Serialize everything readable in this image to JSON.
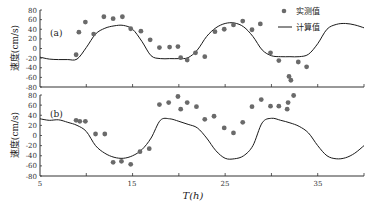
{
  "chart_data": [
    {
      "type": "scatter+line",
      "panel_label": "(a)",
      "xlabel": "T(h)",
      "ylabel": "速度(cm/s)",
      "xlim": [
        5,
        40
      ],
      "ylim": [
        -80,
        80
      ],
      "yticks": [
        80,
        60,
        40,
        20,
        0,
        -20,
        -40,
        -60,
        -80
      ],
      "legend": {
        "measured": "实测值",
        "calculated": "计算值",
        "position": "upper right"
      },
      "measured": {
        "name": "实测值",
        "x": [
          8.9,
          9.2,
          9.9,
          10.8,
          11.9,
          12.9,
          13.9,
          14.8,
          15.9,
          16.9,
          17.9,
          19.0,
          19.9,
          20.2,
          20.9,
          21.8,
          22.8,
          23.9,
          24.9,
          25.9,
          26.9,
          27.9,
          28.8,
          29.9,
          30.8,
          31.9,
          32.1,
          32.9,
          33.8
        ],
        "y": [
          -13,
          34,
          55,
          30,
          66,
          62,
          66,
          41,
          36,
          18,
          2,
          3,
          4,
          -19,
          -24,
          -9,
          -17,
          35,
          40,
          49,
          57,
          39,
          51,
          -9,
          -25,
          -58,
          -66,
          -28,
          -38
        ]
      },
      "calculated": {
        "name": "计算值",
        "x": [
          5,
          6,
          7,
          8,
          9,
          10,
          11,
          12,
          13,
          14,
          15,
          16,
          17,
          18,
          19,
          20,
          21,
          22,
          23,
          24,
          25,
          26,
          27,
          28,
          29,
          30,
          31,
          32,
          33,
          34,
          35,
          36,
          37,
          38,
          39,
          40
        ],
        "y": [
          -18,
          -22,
          -23,
          -23,
          -22,
          2,
          30,
          42,
          47,
          48,
          40,
          15,
          -15,
          -21,
          -21,
          -21,
          -19,
          -3,
          25,
          43,
          52,
          53,
          45,
          25,
          -3,
          -15,
          -17,
          -17,
          -17,
          -12,
          10,
          40,
          50,
          52,
          49,
          43
        ]
      }
    },
    {
      "type": "scatter+line",
      "panel_label": "(b)",
      "xlabel": "T(h)",
      "ylabel": "速度(cm/s)",
      "xlim": [
        5,
        40
      ],
      "ylim": [
        -80,
        80
      ],
      "xticks": [
        5,
        15,
        25,
        35
      ],
      "yticks": [
        80,
        60,
        40,
        20,
        0,
        -20,
        -40,
        -60,
        -80
      ],
      "measured": {
        "name": "实测值",
        "x": [
          8.9,
          9.3,
          9.9,
          11.0,
          12.0,
          12.9,
          13.8,
          14.8,
          15.8,
          16.8,
          17.9,
          18.9,
          19.9,
          20.2,
          20.9,
          21.9,
          22.8,
          23.8,
          24.9,
          25.9,
          26.9,
          27.9,
          28.9,
          29.9,
          30.8,
          31.7,
          31.8,
          32.4
        ],
        "y": [
          30,
          28,
          28,
          3,
          3,
          -53,
          -51,
          -57,
          -32,
          -26,
          61,
          65,
          77,
          52,
          65,
          57,
          32,
          38,
          15,
          5,
          26,
          57,
          71,
          58,
          58,
          52,
          65,
          79
        ]
      },
      "calculated": {
        "name": "计算值",
        "x": [
          5,
          6,
          7,
          8,
          9,
          10,
          11,
          12,
          13,
          14,
          15,
          16,
          17,
          18,
          19,
          20,
          21,
          22,
          23,
          24,
          25,
          26,
          27,
          28,
          29,
          30,
          31,
          32,
          33,
          34,
          35,
          36,
          37,
          38,
          39,
          40
        ],
        "y": [
          33,
          30,
          31,
          26,
          20,
          8,
          -20,
          -35,
          -43,
          -45,
          -40,
          -28,
          -5,
          30,
          33,
          28,
          22,
          15,
          -5,
          -30,
          -45,
          -46,
          -40,
          -20,
          25,
          34,
          30,
          25,
          18,
          5,
          -20,
          -40,
          -46,
          -44,
          -35,
          -20
        ]
      }
    }
  ],
  "labels": {
    "panel_a": "(a)",
    "panel_b": "(b)",
    "ylabel_top": "速度(cm/s)",
    "ylabel_bottom": "速度(cm/s)",
    "xlabel": "T(h)",
    "legend_measured": "实测值",
    "legend_calculated": "计算值",
    "xtick_5": "5",
    "xtick_15": "15",
    "xtick_25": "25",
    "xtick_35": "35"
  },
  "colors": {
    "points": "#6a6a6a",
    "line": "#1a1a1a",
    "axis": "#333333"
  }
}
